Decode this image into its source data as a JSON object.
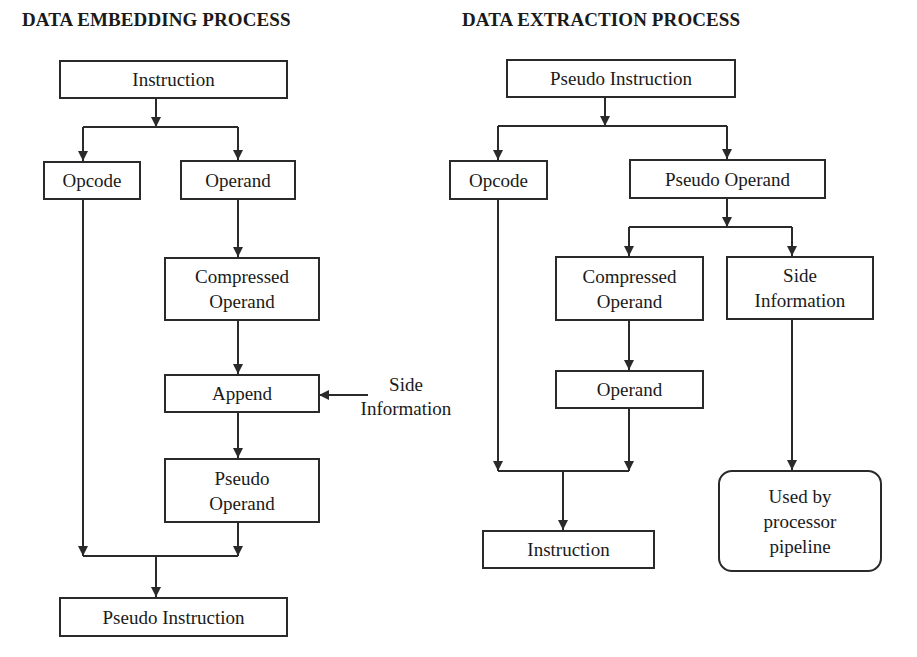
{
  "left_diagram": {
    "title": "DATA EMBEDDING PROCESS",
    "nodes": {
      "instruction": "Instruction",
      "opcode": "Opcode",
      "operand": "Operand",
      "compressed_operand": "Compressed Operand",
      "append": "Append",
      "side_information": "Side Information",
      "pseudo_operand": "Pseudo Operand",
      "pseudo_instruction": "Pseudo Instruction"
    }
  },
  "right_diagram": {
    "title": "DATA EXTRACTION PROCESS",
    "nodes": {
      "pseudo_instruction": "Pseudo Instruction",
      "opcode": "Opcode",
      "pseudo_operand": "Pseudo Operand",
      "compressed_operand": "Compressed Operand",
      "side_information": "Side Information",
      "operand": "Operand",
      "instruction": "Instruction",
      "used_by_pipeline": "Used by processor pipeline"
    }
  }
}
